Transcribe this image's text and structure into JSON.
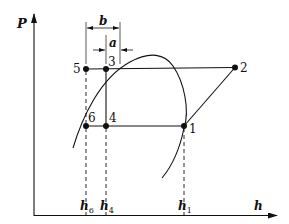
{
  "diagram": {
    "type": "pressure-enthalpy (P-h) refrigeration cycle diagram",
    "axes": {
      "y_label": "P",
      "x_label": "h"
    },
    "points": [
      {
        "id": "1",
        "label": "1"
      },
      {
        "id": "2",
        "label": "2"
      },
      {
        "id": "3",
        "label": "3"
      },
      {
        "id": "4",
        "label": "4"
      },
      {
        "id": "5",
        "label": "5"
      },
      {
        "id": "6",
        "label": "6"
      }
    ],
    "x_ticks": [
      {
        "id": "h6",
        "base": "h",
        "sub": "6"
      },
      {
        "id": "h4",
        "base": "h",
        "sub": "4"
      },
      {
        "id": "h1",
        "base": "h",
        "sub": "1"
      }
    ],
    "dimensions": [
      {
        "id": "b",
        "label": "b"
      },
      {
        "id": "a",
        "label": "a"
      }
    ],
    "colors": {
      "ink": "#111111",
      "background": "#ffffff"
    }
  }
}
